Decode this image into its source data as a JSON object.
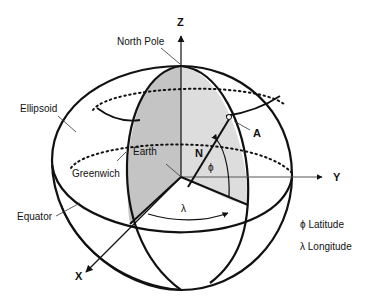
{
  "figure": {
    "colors": {
      "background": "#ffffff",
      "stroke": "#111111",
      "shaded_meridian_left": "#c8c8c8",
      "shaded_meridian_right": "#dcdcdc",
      "thin_line": "#555555"
    },
    "axes": {
      "z": "Z",
      "y": "Y",
      "x": "X"
    },
    "labels": {
      "north_pole": "North Pole",
      "ellipsoid": "Ellipsoid",
      "earth": "Earth",
      "greenwich": "Greenwich",
      "equator": "Equator",
      "point": "A",
      "normal": "N",
      "phi": "ϕ",
      "lambda": "λ"
    },
    "legend": [
      {
        "symbol": "ϕ",
        "text": "Latitude"
      },
      {
        "symbol": "λ",
        "text": "Longitude"
      }
    ]
  }
}
